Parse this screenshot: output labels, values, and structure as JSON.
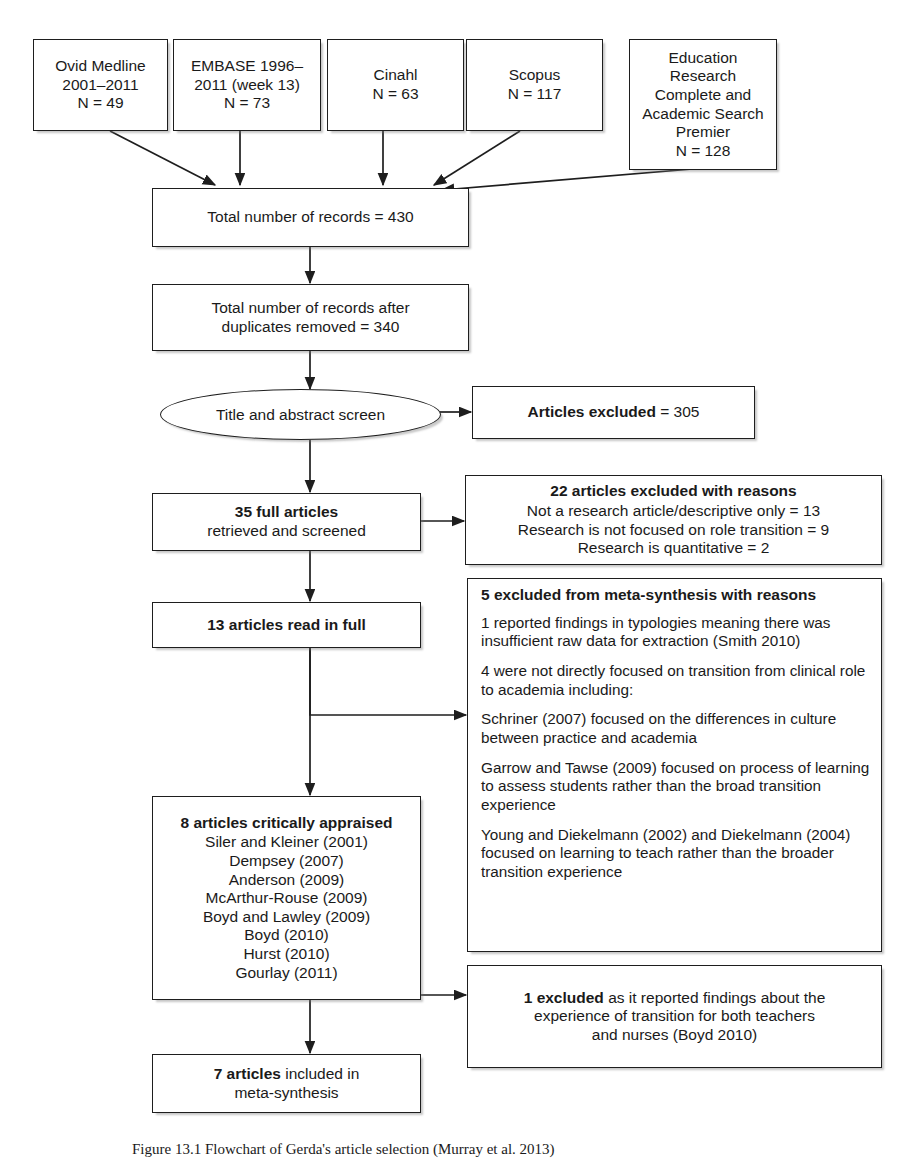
{
  "figure": {
    "caption": "Figure 13.1 Flowchart of Gerda's article selection (Murray et al. 2013)"
  },
  "sources": [
    {
      "name": "ovid-medline",
      "lines": [
        "Ovid Medline",
        "2001–2011",
        "N = 49"
      ]
    },
    {
      "name": "embase",
      "lines": [
        "EMBASE 1996–",
        "2011 (week 13)",
        "N = 73"
      ]
    },
    {
      "name": "cinahl",
      "lines": [
        "Cinahl",
        "N = 63"
      ]
    },
    {
      "name": "scopus",
      "lines": [
        "Scopus",
        "N = 117"
      ]
    },
    {
      "name": "education-research-complete",
      "lines": [
        "Education",
        "Research",
        "Complete and",
        "Academic Search",
        "Premier",
        "N = 128"
      ]
    }
  ],
  "flow": {
    "total_records": {
      "lines": [
        "Total number of records = 430"
      ]
    },
    "after_duplicates": {
      "lines": [
        "Total number of records after",
        "duplicates removed = 340"
      ]
    },
    "screen": {
      "label": "Title and abstract screen"
    },
    "full_articles": {
      "bold": "35 full articles",
      "lines": [
        "retrieved and screened"
      ]
    },
    "read_in_full": {
      "bold": "13 articles read in full"
    },
    "critically_appraised": {
      "heading": "8 articles critically appraised",
      "items": [
        "Siler and Kleiner (2001)",
        "Dempsey (2007)",
        "Anderson (2009)",
        "McArthur-Rouse (2009)",
        "Boyd and Lawley (2009)",
        "Boyd (2010)",
        "Hurst (2010)",
        "Gourlay (2011)"
      ]
    },
    "included": {
      "bold": "7 articles",
      "rest": " included in",
      "line2": "meta-synthesis"
    }
  },
  "exclusions": {
    "articles_excluded": {
      "bold": "Articles excluded",
      "rest": " = 305"
    },
    "reasons_22": {
      "heading": "22 articles excluded with reasons",
      "items": [
        "Not a research article/descriptive only = 13",
        "Research is not focused on role transition = 9",
        "Research is quantitative = 2"
      ]
    },
    "meta_synthesis_5": {
      "heading": "5 excluded from meta-synthesis with reasons",
      "paragraphs": [
        "1 reported findings in typologies meaning there was insufficient raw data for extraction (Smith 2010)",
        "4 were not directly focused on transition from clinical role to academia including:",
        "Schriner (2007) focused on the differences in culture between practice and academia",
        "Garrow and Tawse (2009) focused on process of learning to assess students rather than the broad transition experience",
        "Young and Diekelmann (2002) and Diekelmann (2004) focused on learning to teach rather than the broader transition experience"
      ]
    },
    "excluded_1": {
      "bold": "1 excluded",
      "rest": " as it reported findings about the",
      "line2": "experience of transition for both teachers",
      "line3": "and nurses (Boyd 2010)"
    }
  }
}
